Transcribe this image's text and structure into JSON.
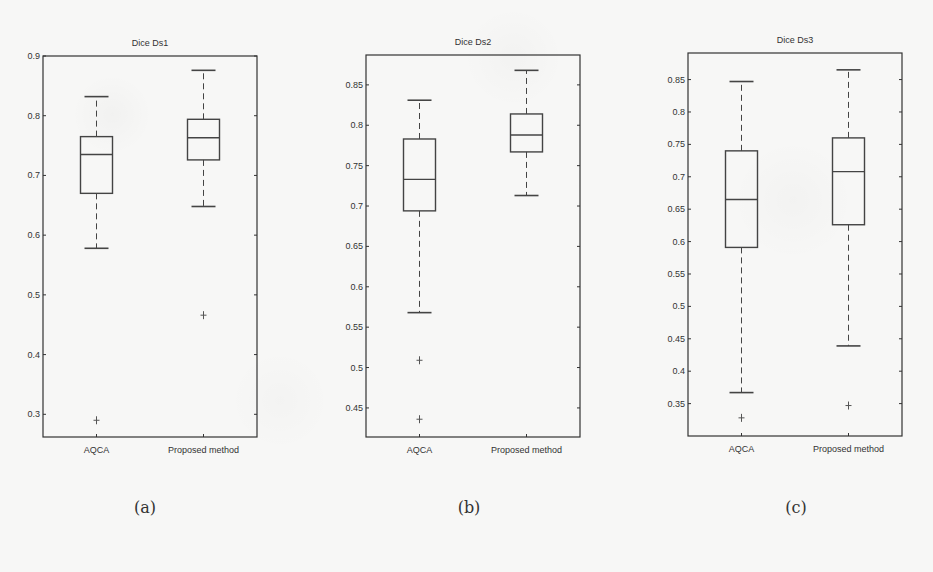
{
  "figure": {
    "captions": [
      "(a)",
      "(b)",
      "(c)"
    ]
  },
  "chart_data": [
    {
      "type": "box",
      "title": "Dice Ds1",
      "caption": "(a)",
      "xlabel": "",
      "ylabel": "",
      "categories": [
        "AQCA",
        "Proposed method"
      ],
      "ylim": [
        0.262,
        0.9
      ],
      "yticks": [
        0.3,
        0.4,
        0.5,
        0.6,
        0.7,
        0.8,
        0.9
      ],
      "ytick_labels": [
        "0.3",
        "0.4",
        "0.5",
        "0.6",
        "0.7",
        "0.8",
        "0.9"
      ],
      "grid": false,
      "series": [
        {
          "name": "AQCA",
          "whisker_low": 0.578,
          "q1": 0.67,
          "median": 0.735,
          "q3": 0.765,
          "whisker_high": 0.832,
          "outliers": [
            0.29
          ]
        },
        {
          "name": "Proposed method",
          "whisker_low": 0.648,
          "q1": 0.726,
          "median": 0.763,
          "q3": 0.794,
          "whisker_high": 0.876,
          "outliers": [
            0.466
          ]
        }
      ],
      "layout": {
        "left": 43,
        "right": 257,
        "top": 56,
        "bottom": 437
      }
    },
    {
      "type": "box",
      "title": "Dice Ds2",
      "caption": "(b)",
      "xlabel": "",
      "ylabel": "",
      "categories": [
        "AQCA",
        "Proposed method"
      ],
      "ylim": [
        0.414,
        0.887
      ],
      "yticks": [
        0.45,
        0.5,
        0.55,
        0.6,
        0.65,
        0.7,
        0.75,
        0.8,
        0.85
      ],
      "ytick_labels": [
        "0.45",
        "0.5",
        "0.55",
        "0.6",
        "0.65",
        "0.7",
        "0.75",
        "0.8",
        "0.85"
      ],
      "grid": false,
      "series": [
        {
          "name": "AQCA",
          "whisker_low": 0.568,
          "q1": 0.694,
          "median": 0.733,
          "q3": 0.783,
          "whisker_high": 0.831,
          "outliers": [
            0.509,
            0.436
          ]
        },
        {
          "name": "Proposed method",
          "whisker_low": 0.713,
          "q1": 0.767,
          "median": 0.788,
          "q3": 0.814,
          "whisker_high": 0.868,
          "outliers": []
        }
      ],
      "layout": {
        "left": 366,
        "right": 580,
        "top": 55,
        "bottom": 437
      }
    },
    {
      "type": "box",
      "title": "Dice Ds3",
      "caption": "(c)",
      "xlabel": "",
      "ylabel": "",
      "categories": [
        "AQCA",
        "Proposed method"
      ],
      "ylim": [
        0.3,
        0.891
      ],
      "yticks": [
        0.35,
        0.4,
        0.45,
        0.5,
        0.55,
        0.6,
        0.65,
        0.7,
        0.75,
        0.8,
        0.85
      ],
      "ytick_labels": [
        "0.35",
        "0.4",
        "0.45",
        "0.5",
        "0.55",
        "0.6",
        "0.65",
        "0.7",
        "0.75",
        "0.8",
        "0.85"
      ],
      "grid": false,
      "series": [
        {
          "name": "AQCA",
          "whisker_low": 0.367,
          "q1": 0.591,
          "median": 0.665,
          "q3": 0.74,
          "whisker_high": 0.847,
          "outliers": [
            0.328
          ]
        },
        {
          "name": "Proposed method",
          "whisker_low": 0.439,
          "q1": 0.626,
          "median": 0.708,
          "q3": 0.76,
          "whisker_high": 0.865,
          "outliers": [
            0.347
          ]
        }
      ],
      "layout": {
        "left": 688,
        "right": 902,
        "top": 53,
        "bottom": 436
      }
    }
  ]
}
